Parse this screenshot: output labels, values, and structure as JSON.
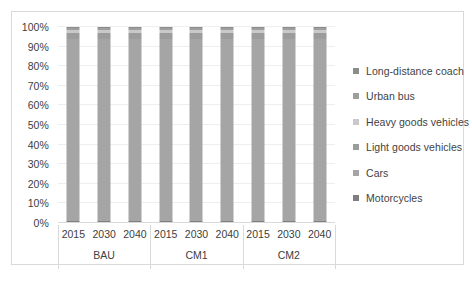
{
  "chart_data": {
    "type": "bar",
    "variant": "stacked-100-percent",
    "title": "",
    "xlabel": "",
    "ylabel": "",
    "ylim": [
      0,
      100
    ],
    "ytick_labels": [
      "0%",
      "10%",
      "20%",
      "30%",
      "40%",
      "50%",
      "60%",
      "70%",
      "80%",
      "90%",
      "100%"
    ],
    "ytick_values": [
      0,
      10,
      20,
      30,
      40,
      50,
      60,
      70,
      80,
      90,
      100
    ],
    "grid": true,
    "legend_position": "right",
    "groups": [
      "BAU",
      "CM1",
      "CM2"
    ],
    "categories": [
      "2015",
      "2030",
      "2040",
      "2015",
      "2030",
      "2040",
      "2015",
      "2030",
      "2040"
    ],
    "series": [
      {
        "name": "Motorcycles",
        "color": "#7f7f7f",
        "values": [
          1.0,
          1.0,
          1.0,
          1.0,
          1.0,
          1.0,
          1.0,
          1.0,
          1.0
        ]
      },
      {
        "name": "Cars",
        "color": "#a5a5a5",
        "values": [
          93.0,
          93.0,
          93.0,
          93.0,
          93.0,
          93.0,
          93.0,
          93.0,
          93.0
        ]
      },
      {
        "name": "Light goods vehicles",
        "color": "#9c9c9c",
        "values": [
          3.0,
          3.0,
          3.0,
          3.0,
          3.0,
          3.0,
          3.0,
          3.0,
          3.0
        ]
      },
      {
        "name": "Heavy goods vehicles",
        "color": "#c9c9c9",
        "values": [
          1.5,
          1.5,
          1.5,
          1.5,
          1.5,
          1.5,
          1.5,
          1.5,
          1.5
        ]
      },
      {
        "name": "Urban bus",
        "color": "#9e9e9e",
        "values": [
          1.0,
          1.0,
          1.0,
          1.0,
          1.0,
          1.0,
          1.0,
          1.0,
          1.0
        ]
      },
      {
        "name": "Long-distance coach",
        "color": "#8c8c8c",
        "values": [
          0.5,
          0.5,
          0.5,
          0.5,
          0.5,
          0.5,
          0.5,
          0.5,
          0.5
        ]
      }
    ],
    "legend_entries": [
      {
        "label": "Long-distance coach",
        "color": "#8c8c8c"
      },
      {
        "label": "Urban bus",
        "color": "#9e9e9e"
      },
      {
        "label": "Heavy goods vehicles",
        "color": "#c9c9c9"
      },
      {
        "label": "Light goods vehicles",
        "color": "#9c9c9c"
      },
      {
        "label": "Cars",
        "color": "#a5a5a5"
      },
      {
        "label": "Motorcycles",
        "color": "#7f7f7f"
      }
    ]
  },
  "colors": {
    "border": "#d9d9d9",
    "gridline": "#eceff1",
    "text": "#404040",
    "background": "#ffffff"
  }
}
